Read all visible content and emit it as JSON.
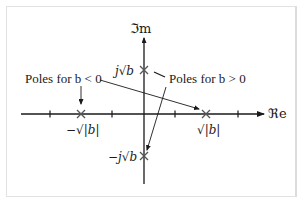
{
  "diagram": {
    "axes": {
      "imag_label": "ℑm",
      "real_label": "ℜe"
    },
    "poles": [
      {
        "id": "pos-real",
        "label": "√|b|",
        "case": "b < 0"
      },
      {
        "id": "neg-real",
        "label": "−√|b|",
        "case": "b < 0"
      },
      {
        "id": "pos-imag",
        "label": "j√b",
        "case": "b > 0"
      },
      {
        "id": "neg-imag",
        "label": "−j√b",
        "case": "b > 0"
      }
    ],
    "annotations": {
      "neg_b": "Poles for b < 0",
      "pos_b": "Poles for b > 0"
    },
    "colors": {
      "stroke": "#1a1a1a",
      "marker": "#555555",
      "border": "#e2e2e2"
    }
  }
}
